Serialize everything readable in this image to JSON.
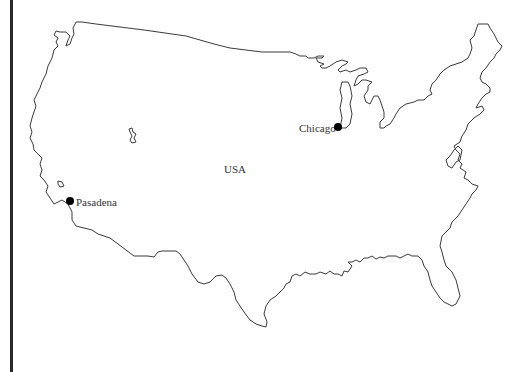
{
  "map": {
    "country_label": "USA",
    "outline_color": "#3a3a3a",
    "marker_color": "#000000",
    "cities": [
      {
        "name": "Chicago",
        "label_side": "left"
      },
      {
        "name": "Pasadena",
        "label_side": "right"
      }
    ]
  }
}
